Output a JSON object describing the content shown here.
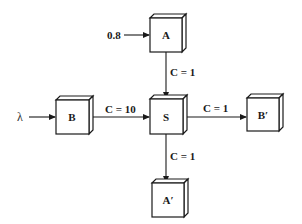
{
  "diagram": {
    "nodes": [
      {
        "id": "A",
        "label": "A"
      },
      {
        "id": "S",
        "label": "S"
      },
      {
        "id": "B",
        "label": "B"
      },
      {
        "id": "Bp",
        "label": "B′"
      },
      {
        "id": "Ap",
        "label": "A′"
      }
    ],
    "inputs": [
      {
        "id": "in-A",
        "label": "0.8",
        "target": "A"
      },
      {
        "id": "in-B",
        "label": "λ",
        "target": "B"
      }
    ],
    "edges": [
      {
        "id": "A-S",
        "from": "A",
        "to": "S",
        "label": "C = 1"
      },
      {
        "id": "B-S",
        "from": "B",
        "to": "S",
        "label": "C = 10"
      },
      {
        "id": "S-Bp",
        "from": "S",
        "to": "Bp",
        "label": "C = 1"
      },
      {
        "id": "S-Ap",
        "from": "S",
        "to": "Ap",
        "label": "C = 1"
      }
    ]
  }
}
